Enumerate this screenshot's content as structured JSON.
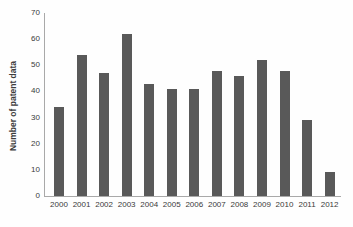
{
  "chart_data": {
    "type": "bar",
    "title": "",
    "xlabel": "",
    "ylabel": "Number of patent data",
    "categories": [
      "2000",
      "2001",
      "2002",
      "2003",
      "2004",
      "2005",
      "2006",
      "2007",
      "2008",
      "2009",
      "2010",
      "2011",
      "2012"
    ],
    "values": [
      34,
      54,
      47,
      62,
      43,
      41,
      41,
      48,
      46,
      52,
      48,
      29,
      9
    ],
    "ylim": [
      0,
      70
    ],
    "yticks": [
      0,
      10,
      20,
      30,
      40,
      50,
      60,
      70
    ],
    "grid": false,
    "legend": "none",
    "bar_color": "#595959",
    "axis_color": "#a9a9a9",
    "text_color": "#3a3a3a"
  }
}
